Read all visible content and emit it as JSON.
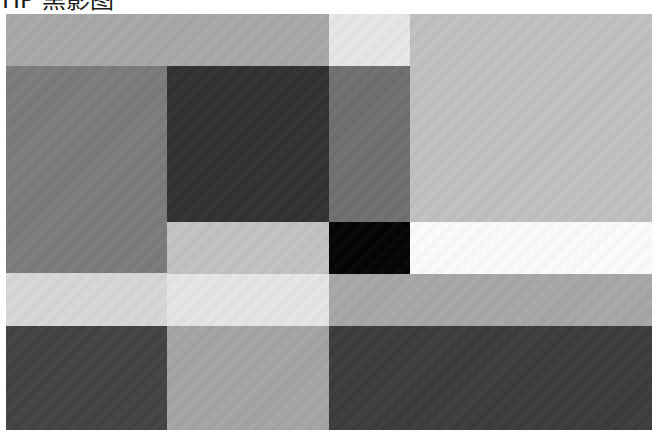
{
  "title": "HP 黑影图",
  "blocks": [
    {
      "name": "block-r1-left",
      "x": 6,
      "y": 14,
      "w": 323,
      "h": 52,
      "color": "#a9a9a9"
    },
    {
      "name": "block-r1-mid",
      "x": 329,
      "y": 14,
      "w": 81,
      "h": 52,
      "color": "#e9e9e9"
    },
    {
      "name": "block-r1-right",
      "x": 410,
      "y": 14,
      "w": 242,
      "h": 208,
      "color": "#c2c2c2"
    },
    {
      "name": "block-r2-left",
      "x": 6,
      "y": 66,
      "w": 161,
      "h": 207,
      "color": "#7b7b7b"
    },
    {
      "name": "block-r2-c2",
      "x": 167,
      "y": 66,
      "w": 162,
      "h": 156,
      "color": "#2f2f2f"
    },
    {
      "name": "block-r2-c3",
      "x": 329,
      "y": 66,
      "w": 81,
      "h": 156,
      "color": "#6f6f6f"
    },
    {
      "name": "block-r3-c2",
      "x": 167,
      "y": 222,
      "w": 162,
      "h": 52,
      "color": "#c4c4c4"
    },
    {
      "name": "block-r3-c3",
      "x": 329,
      "y": 222,
      "w": 81,
      "h": 52,
      "color": "#000000"
    },
    {
      "name": "block-r3-right",
      "x": 410,
      "y": 222,
      "w": 242,
      "h": 52,
      "color": "#ffffff"
    },
    {
      "name": "block-r4-left",
      "x": 6,
      "y": 273,
      "w": 161,
      "h": 53,
      "color": "#d9d9d9"
    },
    {
      "name": "block-r4-c2",
      "x": 167,
      "y": 274,
      "w": 162,
      "h": 52,
      "color": "#e8e8e8"
    },
    {
      "name": "block-r4-right",
      "x": 329,
      "y": 274,
      "w": 323,
      "h": 52,
      "color": "#a8a8a8"
    },
    {
      "name": "block-r5-left",
      "x": 6,
      "y": 326,
      "w": 161,
      "h": 104,
      "color": "#414141"
    },
    {
      "name": "block-r5-c2",
      "x": 167,
      "y": 326,
      "w": 162,
      "h": 104,
      "color": "#a5a5a5"
    },
    {
      "name": "block-r5-right",
      "x": 329,
      "y": 326,
      "w": 323,
      "h": 104,
      "color": "#3a3a3a"
    }
  ]
}
